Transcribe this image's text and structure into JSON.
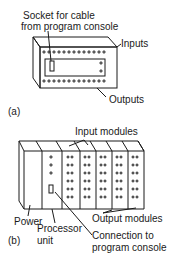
{
  "figure_a": {
    "caption": "(a)",
    "labels": {
      "socket_line1": "Socket for cable",
      "socket_line2": "from program console",
      "inputs": "Inputs",
      "outputs": "Outputs"
    }
  },
  "figure_b": {
    "caption": "(b)",
    "labels": {
      "input_modules": "Input modules",
      "output_modules": "Output modules",
      "power": "Power",
      "processor_line1": "Processor",
      "processor_line2": "unit",
      "connection_line1": "Connection to",
      "connection_line2": "program console"
    }
  }
}
